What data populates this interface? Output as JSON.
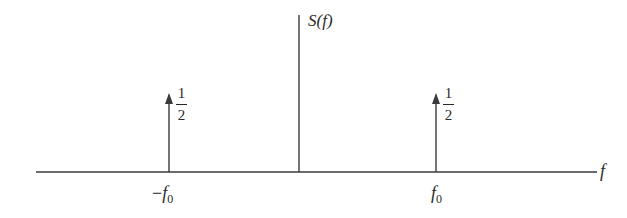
{
  "diagram": {
    "type": "frequency-spectrum",
    "y_axis_label": "S(f)",
    "x_axis_label": "f",
    "impulses": [
      {
        "position_label_sign": "−",
        "position_label_var": "f",
        "position_label_sub": "0",
        "weight_num": "1",
        "weight_den": "2"
      },
      {
        "position_label_sign": "",
        "position_label_var": "f",
        "position_label_sub": "0",
        "weight_num": "1",
        "weight_den": "2"
      }
    ],
    "colors": {
      "line": "#3a3a3a",
      "text": "#2a2a2a",
      "background": "#ffffff"
    }
  }
}
